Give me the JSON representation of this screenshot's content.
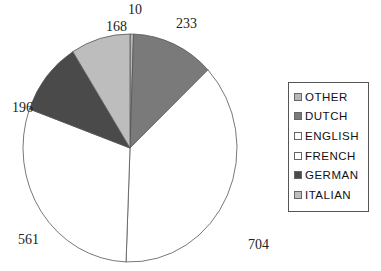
{
  "chart_data": {
    "type": "pie",
    "title": "",
    "categories": [
      "OTHER",
      "DUTCH",
      "ENGLISH",
      "FRENCH",
      "GERMAN",
      "ITALIAN"
    ],
    "values": [
      10,
      233,
      704,
      561,
      196,
      168
    ],
    "colors": [
      "#b8b8b8",
      "#7a7a7a",
      "#ffffff",
      "#ffffff",
      "#4a4a4a",
      "#bdbdbd"
    ],
    "start_angle": "12 o'clock",
    "direction": "clockwise",
    "data_labels": [
      "10",
      "233",
      "704",
      "561",
      "196",
      "168"
    ],
    "legend": {
      "placement": "right",
      "entries": [
        "OTHER",
        "DUTCH",
        "ENGLISH",
        "FRENCH",
        "GERMAN",
        "ITALIAN"
      ]
    }
  }
}
